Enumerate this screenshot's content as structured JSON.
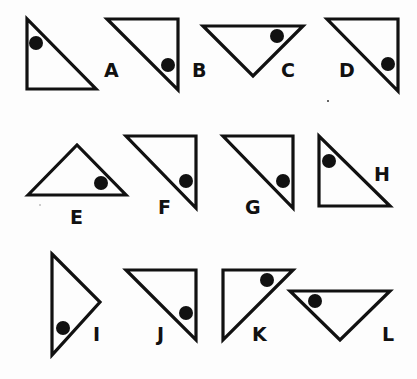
{
  "figure": {
    "colors": {
      "ink": "#111111",
      "background": "#fdfdfd"
    },
    "items": [
      {
        "label": "A",
        "points": "27,19 27,89 96,89",
        "dot": [
          36,
          43
        ],
        "labelPos": [
          104,
          77
        ]
      },
      {
        "label": "B",
        "points": "107,19 178,19 178,90",
        "dot": [
          168,
          65
        ],
        "labelPos": [
          192,
          77
        ]
      },
      {
        "label": "C",
        "points": "203,26 303,26 253,76",
        "dot": [
          277,
          36
        ],
        "labelPos": [
          281,
          77
        ]
      },
      {
        "label": "D",
        "points": "327,19 398,19 398,91",
        "dot": [
          388,
          64
        ],
        "labelPos": [
          339,
          77
        ]
      },
      {
        "label": "E",
        "points": "28,195 77,145 126,195",
        "dot": [
          101,
          183
        ],
        "labelPos": [
          70,
          224
        ]
      },
      {
        "label": "F",
        "points": "126,136 196,136 196,208",
        "dot": [
          186,
          181
        ],
        "labelPos": [
          158,
          214
        ]
      },
      {
        "label": "G",
        "points": "223,136 293,136 293,208",
        "dot": [
          283,
          181
        ],
        "labelPos": [
          245,
          214
        ]
      },
      {
        "label": "H",
        "points": "319,136 319,206 390,206",
        "dot": [
          329,
          161
        ],
        "labelPos": [
          374,
          181
        ]
      },
      {
        "label": "I",
        "points": "52,254 100,302 52,355",
        "dot": [
          63,
          328
        ],
        "labelPos": [
          93,
          341
        ]
      },
      {
        "label": "J",
        "points": "126,270 196,270 196,340",
        "dot": [
          186,
          313
        ],
        "labelPos": [
          157,
          341
        ]
      },
      {
        "label": "K",
        "points": "223,270 293,270 223,340",
        "dot": [
          267,
          280
        ],
        "labelPos": [
          252,
          341
        ]
      },
      {
        "label": "L",
        "points": "290,291 390,291 340,340",
        "dot": [
          315,
          301
        ],
        "labelPos": [
          382,
          341
        ]
      }
    ]
  }
}
